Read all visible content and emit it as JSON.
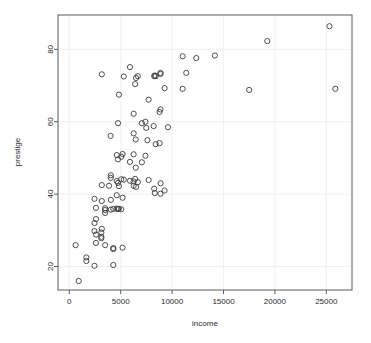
{
  "chart_data": {
    "type": "scatter",
    "title": "",
    "xlabel": "income",
    "ylabel": "prestige",
    "xlim": [
      -1100,
      27500
    ],
    "ylim": [
      13.5,
      89.5
    ],
    "grid": true,
    "legend": null,
    "legend_position": "none",
    "xticks": [
      0,
      5000,
      10000,
      15000,
      20000,
      25000
    ],
    "xtick_labels": [
      "0",
      "5000",
      "10000",
      "15000",
      "20000",
      "25000"
    ],
    "yticks": [
      20,
      40,
      60,
      80
    ],
    "ytick_labels": [
      "20",
      "40",
      "60",
      "80"
    ],
    "marker": "open-circle",
    "marker_size": 2.6,
    "marker_color": "#3c3c3c",
    "frame_color": "#5a5a5a",
    "grid_color": "#f0f0f0",
    "background_color": "#ffffff",
    "x": [
      12351,
      25879,
      9271,
      8865,
      8403,
      11030,
      8258,
      14163,
      11377,
      11023,
      5902,
      19263,
      25308,
      17498,
      6664,
      6492,
      6403,
      3161,
      5299,
      4825,
      7716,
      8880,
      8316,
      6259,
      7405,
      7482,
      8780,
      7059,
      6259,
      8865,
      8206,
      4741,
      4014,
      6462,
      9593,
      7597,
      5180,
      4614,
      4741,
      5902,
      5052,
      8780,
      8403,
      6259,
      7405,
      4036,
      6462,
      5052,
      6259,
      7059,
      6259,
      5180,
      3161,
      3861,
      4036,
      4741,
      4614,
      4825,
      5299,
      5902,
      6403,
      6664,
      6492,
      7716,
      8258,
      8316,
      8865,
      8880,
      9271,
      4614,
      4036,
      3161,
      2448,
      2594,
      3485,
      3485,
      2594,
      2448,
      1656,
      1656,
      3114,
      3114,
      3485,
      4279,
      4279,
      5180,
      2594,
      3161,
      4614,
      4741,
      3485,
      2448,
      3114,
      2594,
      4036,
      4279,
      5052,
      4825,
      2448,
      611,
      914,
      4279
    ],
    "y": [
      77.6,
      69.1,
      69.3,
      73.5,
      72.6,
      78.1,
      72.6,
      78.3,
      73.5,
      69.1,
      75.1,
      82.3,
      86.4,
      68.8,
      72.6,
      72.1,
      70.4,
      73.1,
      72.5,
      67.5,
      66.1,
      73.2,
      72.8,
      62.2,
      60.0,
      58.3,
      62.7,
      59.6,
      56.8,
      63.4,
      58.8,
      59.6,
      56.1,
      55.1,
      58.5,
      54.9,
      51.1,
      50.8,
      49.6,
      48.9,
      50.3,
      54.1,
      53.8,
      51.0,
      50.6,
      45.2,
      47.3,
      44.1,
      43.5,
      48.8,
      42.3,
      39.0,
      42.5,
      42.3,
      44.5,
      43.1,
      43.6,
      42.2,
      44.0,
      43.7,
      44.2,
      43.3,
      42.0,
      43.9,
      41.5,
      40.3,
      40.1,
      43.0,
      41.0,
      39.7,
      38.4,
      38.1,
      38.7,
      36.2,
      35.6,
      34.8,
      33.1,
      32.0,
      21.5,
      22.5,
      29.4,
      27.8,
      25.9,
      25.1,
      24.8,
      25.2,
      28.8,
      30.4,
      36.0,
      35.9,
      36.1,
      29.8,
      28.2,
      26.5,
      35.7,
      35.9,
      35.8,
      35.9,
      20.2,
      25.9,
      16.0,
      20.4
    ]
  },
  "figure": {
    "plot_area": {
      "left": 58,
      "top": 15,
      "right": 352,
      "bottom": 290
    }
  }
}
